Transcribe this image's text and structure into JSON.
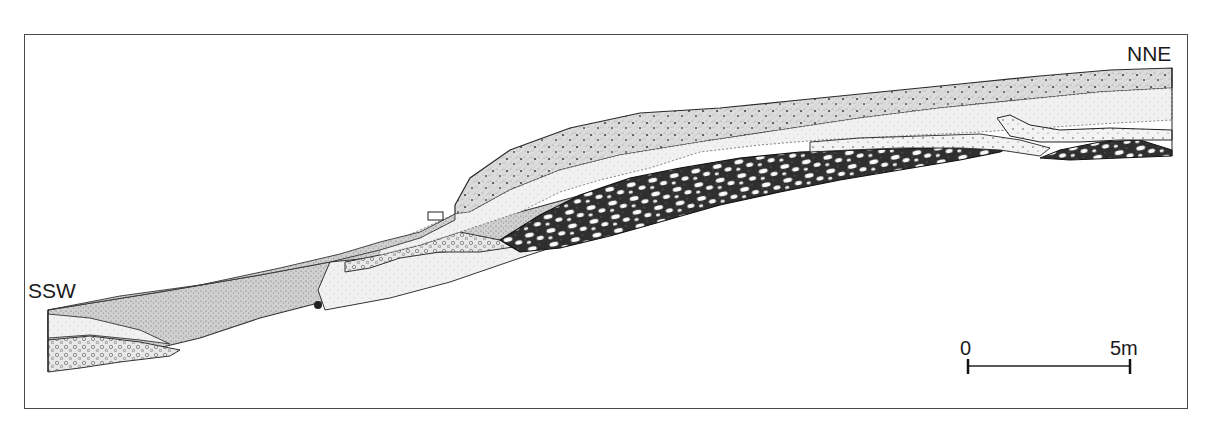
{
  "figure": {
    "type": "stratigraphic cross-section drawing",
    "orientation": {
      "left_label": "SSW",
      "right_label": "NNE"
    },
    "scale_bar": {
      "start_label": "0",
      "end_label": "5m",
      "length_m": 5
    },
    "layers": [
      {
        "name": "upper-dotted-sand",
        "pattern": "stippled with dots",
        "color": "#d8d8d8"
      },
      {
        "name": "light-sand-band",
        "pattern": "fine stipple",
        "color": "#eeeeee"
      },
      {
        "name": "dark-cobble-gravel",
        "pattern": "dark matrix with white oval clasts",
        "color": "#3a3a3a"
      },
      {
        "name": "coarse-dotted-lens",
        "pattern": "open circles/dots",
        "color": "#e4e4e4"
      },
      {
        "name": "lower-grey-sand",
        "pattern": "dense stipple",
        "color": "#cfcfcf"
      }
    ],
    "colors": {
      "frame": "#4a4a4a",
      "ink": "#1a1a1a",
      "background": "#ffffff"
    }
  },
  "caption_fragment": "(cropped caption text, unreadable)"
}
